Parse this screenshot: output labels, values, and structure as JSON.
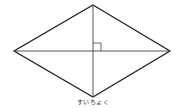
{
  "diagram": {
    "shape": "rhombus",
    "vertices": {
      "top": [
        93,
        5
      ],
      "left": [
        14,
        51
      ],
      "right": [
        170,
        51
      ],
      "bottom": [
        93,
        97
      ]
    },
    "diagonals": [
      "vertical",
      "horizontal"
    ],
    "right_angle_marker": {
      "at": [
        93,
        51
      ],
      "size": 8,
      "quadrant": "upper-right"
    },
    "stroke_color": "#222222",
    "caption": "すいちょく"
  }
}
